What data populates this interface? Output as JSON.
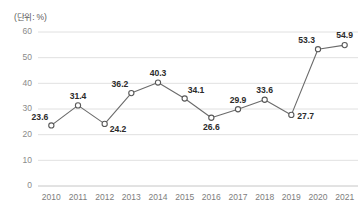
{
  "unit_note": "(단위: %)",
  "chart_data": {
    "type": "line",
    "title": "",
    "subtitle": "",
    "xlabel": "",
    "ylabel": "",
    "unit": "%",
    "categories": [
      "2010",
      "2011",
      "2012",
      "2013",
      "2014",
      "2015",
      "2016",
      "2017",
      "2018",
      "2019",
      "2020",
      "2021"
    ],
    "values": [
      23.6,
      31.4,
      24.2,
      36.2,
      40.3,
      34.1,
      26.6,
      29.9,
      33.6,
      27.7,
      53.3,
      54.9
    ],
    "point_labels": [
      "23.6",
      "31.4",
      "24.2",
      "36.2",
      "40.3",
      "34.1",
      "26.6",
      "29.9",
      "33.6",
      "27.7",
      "53.3",
      "54.9"
    ],
    "label_positions": [
      "above-left",
      "above",
      "below-right",
      "above-left",
      "above",
      "above-right",
      "below",
      "above",
      "above",
      "right",
      "above-left",
      "above"
    ],
    "ylim": [
      0,
      60
    ],
    "yticks": [
      0,
      10,
      20,
      30,
      40,
      50,
      60
    ],
    "ytick_labels": [
      "0",
      "10",
      "20",
      "30",
      "40",
      "50",
      "60"
    ],
    "grid": true,
    "grid_axis": "y",
    "legend": false,
    "legend_position": "none",
    "marker": "open-circle",
    "line_color": "#6b6b6b",
    "marker_fill": "#ffffff",
    "marker_stroke": "#595959",
    "grid_color": "#d8d8d8",
    "tick_color": "#8a8a8a",
    "label_color": "#2b2b2b",
    "background": "#ffffff"
  }
}
